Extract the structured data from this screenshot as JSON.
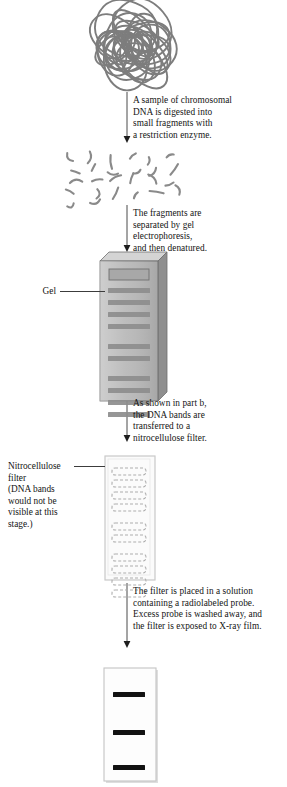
{
  "figure": {
    "background_color": "#ffffff",
    "ink_color": "#141414"
  },
  "steps": [
    {
      "id": "step-1",
      "text": "A sample of chromosomal\nDNA is digested into\nsmall fragments with\na restriction enzyme.",
      "x": 133,
      "y": 95,
      "width": 152
    },
    {
      "id": "step-2",
      "text": "The fragments are\nseparated by gel\nelectrophoresis,\nand then denatured.",
      "x": 133,
      "y": 208,
      "width": 152
    },
    {
      "id": "step-3",
      "text": "As shown in part b,\nthe DNA bands are\ntransferred to a\nnitrocellulose filter.",
      "x": 133,
      "y": 398,
      "width": 152
    },
    {
      "id": "step-4",
      "text": "The filter is placed in a solution\ncontaining a radiolabeled probe.\nExcess probe is washed away, and\nthe filter is exposed to X-ray film.",
      "x": 133,
      "y": 586,
      "width": 154
    }
  ],
  "labels": [
    {
      "id": "gel-label",
      "text": "Gel",
      "x": 8,
      "y": 286,
      "width": 48,
      "align": "right",
      "leader": {
        "x": 60,
        "y": 291,
        "length": 45
      }
    },
    {
      "id": "filter-label",
      "text": "Nitrocellulose\nfilter\n(DNA bands\nwould not be\nvisible at this\nstage.)",
      "x": 8,
      "y": 461,
      "width": 72,
      "align": "left",
      "leader": {
        "x": 74,
        "y": 466,
        "length": 31
      }
    }
  ],
  "arrows": [
    {
      "id": "arrow-1",
      "x": 127,
      "y_top": 92,
      "y_bottom": 143
    },
    {
      "id": "arrow-2",
      "x": 127,
      "y_top": 205,
      "y_bottom": 252
    },
    {
      "id": "arrow-3",
      "x": 127,
      "y_top": 395,
      "y_bottom": 442
    },
    {
      "id": "arrow-4",
      "x": 127,
      "y_top": 583,
      "y_bottom": 648
    }
  ],
  "chromosomal_dna": {
    "id": "chromosomal-dna-tangle",
    "description": "tangled supercoiled chromosomal DNA mass",
    "center_x": 132,
    "center_y": 46,
    "radius": 44,
    "stroke_color": "#7d7d7d",
    "stroke_width": 1.9,
    "loop_count": 26
  },
  "dna_fragments": {
    "id": "dna-fragments-scatter",
    "description": "scattered short restriction fragments",
    "center_x": 128,
    "center_y": 180,
    "count": 26,
    "stroke_color": "#8a8a8a",
    "stroke_width": 2.1
  },
  "gel": {
    "id": "gel-slab",
    "x": 100,
    "y": 252,
    "width": 58,
    "height": 140,
    "depth": 9,
    "face_color": "#b9b9b9",
    "top_color": "#d4d4d4",
    "side_color": "#8f8f8f",
    "edge_color": "#6f6f6f",
    "well": {
      "y_offset": 8,
      "height": 11,
      "fill": "#a8a8a8",
      "stroke": "#707070"
    },
    "band_color": "#8d8d8d",
    "band_height": 5,
    "bands_y": [
      27,
      39,
      51,
      63,
      83,
      95,
      115,
      127,
      139,
      151
    ]
  },
  "filter": {
    "id": "nitrocellulose-filter",
    "x": 104,
    "y": 455,
    "width": 50,
    "height": 124,
    "face_color": "#fbfbfb",
    "edge_color": "#c9c9c9",
    "band_stroke": "#aeaeae",
    "band_dash": "3 2",
    "band_height": 7,
    "bands_y": [
      13,
      25,
      37,
      49,
      68,
      80,
      99,
      111,
      123,
      135
    ]
  },
  "film": {
    "id": "xray-film",
    "x": 103,
    "y": 667,
    "width": 52,
    "height": 113,
    "face_color": "#fdfdfd",
    "edge_color": "#c4c4c4",
    "band_color": "#121212",
    "band_height": 5,
    "band_inset": 10,
    "bands_y": [
      25,
      63,
      98
    ]
  }
}
